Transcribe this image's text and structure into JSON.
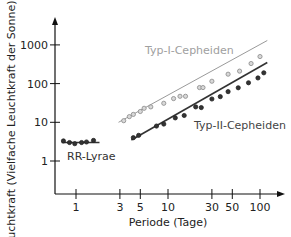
{
  "chart_data": {
    "type": "scatter",
    "title": "",
    "xlabel": "Periode (Tage)",
    "ylabel": "Leuchtkraft  (Vielfache Leuchtkraft der Sonne)",
    "xscale": "log",
    "yscale": "log",
    "xlim": [
      0.7,
      130
    ],
    "ylim": [
      0.5,
      3000
    ],
    "grid": false,
    "legend": "inline labels",
    "x_ticks": [
      1,
      3,
      5,
      10,
      30,
      50,
      100
    ],
    "x_tick_labels": [
      "1",
      "3",
      "5",
      "10",
      "30",
      "50",
      "100"
    ],
    "y_ticks": [
      1,
      10,
      100,
      1000
    ],
    "y_tick_labels": [
      "1",
      "10",
      "100",
      "1000"
    ],
    "series": [
      {
        "name": "Typ-I-Cepheiden",
        "color": "#9a9a9a",
        "marker": "open-circle",
        "fit_line": {
          "x": [
            2.9,
            120
          ],
          "y": [
            10,
            1300
          ]
        },
        "points": [
          {
            "x": 3.3,
            "y": 11
          },
          {
            "x": 3.8,
            "y": 14
          },
          {
            "x": 4.2,
            "y": 16
          },
          {
            "x": 5.0,
            "y": 19
          },
          {
            "x": 5.5,
            "y": 23
          },
          {
            "x": 6.5,
            "y": 25
          },
          {
            "x": 9.0,
            "y": 31
          },
          {
            "x": 11.5,
            "y": 41
          },
          {
            "x": 13.5,
            "y": 47
          },
          {
            "x": 15.5,
            "y": 47
          },
          {
            "x": 22,
            "y": 79
          },
          {
            "x": 24,
            "y": 79
          },
          {
            "x": 30,
            "y": 115
          },
          {
            "x": 45,
            "y": 175
          },
          {
            "x": 60,
            "y": 210
          },
          {
            "x": 80,
            "y": 330
          },
          {
            "x": 100,
            "y": 500
          }
        ]
      },
      {
        "name": "Typ-II-Cepheiden",
        "color": "#333333",
        "marker": "filled-circle",
        "fit_line": {
          "x": [
            4,
            120
          ],
          "y": [
            3.5,
            350
          ]
        },
        "points": [
          {
            "x": 4.2,
            "y": 4.0
          },
          {
            "x": 4.8,
            "y": 4.6
          },
          {
            "x": 7.5,
            "y": 8
          },
          {
            "x": 9.0,
            "y": 9
          },
          {
            "x": 12,
            "y": 13
          },
          {
            "x": 15,
            "y": 15
          },
          {
            "x": 20,
            "y": 25
          },
          {
            "x": 23,
            "y": 24
          },
          {
            "x": 30,
            "y": 40
          },
          {
            "x": 37,
            "y": 46
          },
          {
            "x": 45,
            "y": 62
          },
          {
            "x": 58,
            "y": 78
          },
          {
            "x": 75,
            "y": 105
          },
          {
            "x": 95,
            "y": 140
          },
          {
            "x": 110,
            "y": 190
          }
        ]
      },
      {
        "name": "RR-Lyrae",
        "color": "#333333",
        "marker": "filled-circle",
        "fit_line": {
          "x": [
            0.7,
            1.8
          ],
          "y": [
            3,
            3
          ]
        },
        "points": [
          {
            "x": 0.73,
            "y": 3.3
          },
          {
            "x": 0.85,
            "y": 3.0
          },
          {
            "x": 0.97,
            "y": 2.8
          },
          {
            "x": 1.15,
            "y": 3.0
          },
          {
            "x": 1.3,
            "y": 3.1
          },
          {
            "x": 1.55,
            "y": 3.4
          }
        ]
      }
    ],
    "annotations": [
      {
        "text": "Typ-I-Cepheiden",
        "color": "#a0a0a0"
      },
      {
        "text": "Typ-II-Cepheiden",
        "color": "#444444"
      },
      {
        "text": "RR-Lyrae",
        "color": "#333333"
      }
    ]
  },
  "layout": {
    "plot": {
      "x0": 55,
      "y_axis_top": 17,
      "x_axis_y": 194,
      "x_axis_right": 285
    },
    "xmap": {
      "origin": 76,
      "per_decade": 92
    },
    "ymap": {
      "origin": 161,
      "per_decade": 38.7
    }
  },
  "labels": {
    "ylabel": "Leuchtkraft  (Vielfache Leuchtkraft der Sonne)",
    "xlabel": "Periode (Tage)",
    "typ1": "Typ-I-Cepheiden",
    "typ2": "Typ-II-Cepheiden",
    "rr": "RR-Lyrae"
  }
}
